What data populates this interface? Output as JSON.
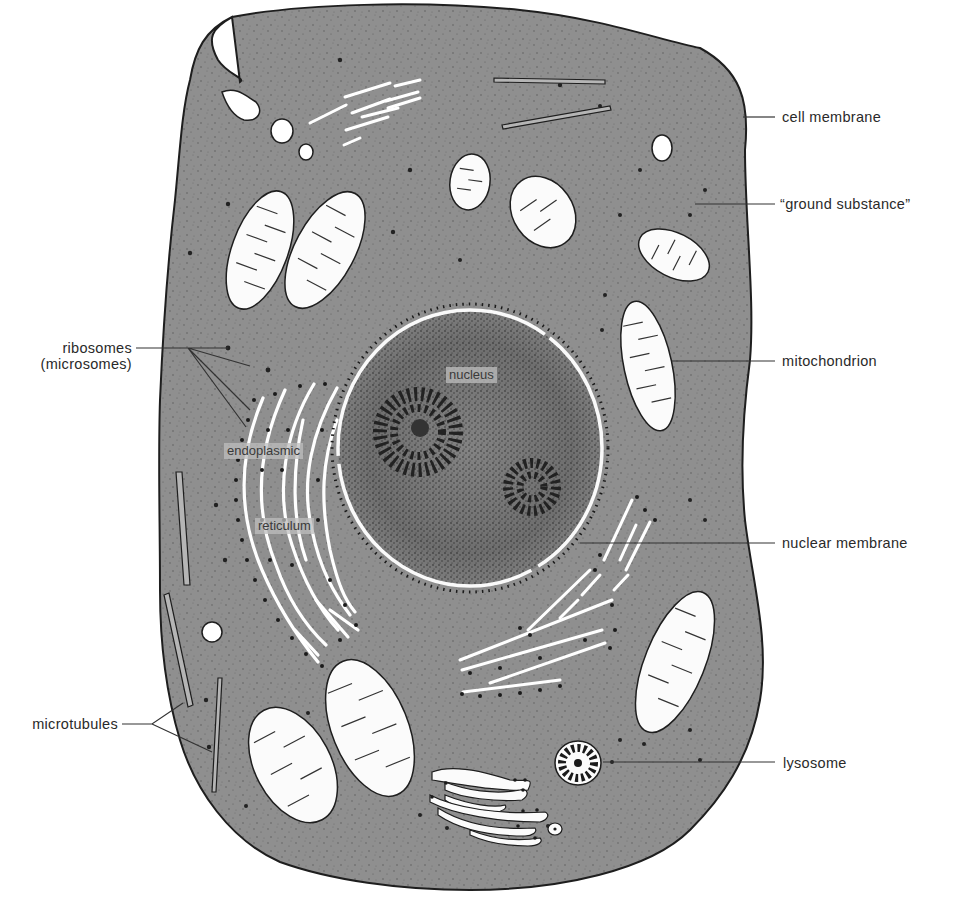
{
  "figure": {
    "colors": {
      "background": "#ffffff",
      "cytoplasm": "#8f8f8f",
      "nucleoplasm": "#7a7a7a",
      "outline": "#1e1e1e",
      "organelle_fill": "#fbfbfb",
      "leader_line": "#333333",
      "label_text": "#2a2a2a"
    }
  },
  "labels": {
    "right": [
      {
        "id": "cell-membrane",
        "text": "cell membrane"
      },
      {
        "id": "ground-substance",
        "text": "“ground substance”"
      },
      {
        "id": "mitochondrion",
        "text": "mitochondrion"
      },
      {
        "id": "nuclear-membrane",
        "text": "nuclear membrane"
      },
      {
        "id": "lysosome",
        "text": "lysosome"
      }
    ],
    "left": [
      {
        "id": "ribosomes",
        "line1": "ribosomes",
        "line2": "(microsomes)"
      },
      {
        "id": "microtubules",
        "text": "microtubules"
      }
    ],
    "inside": {
      "nucleus": "nucleus",
      "er_line1": "endoplasmic",
      "er_line2": "reticulum"
    }
  }
}
